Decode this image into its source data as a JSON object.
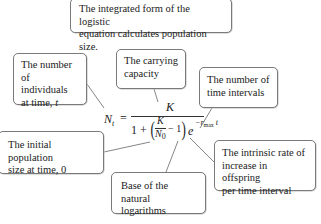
{
  "title_box": {
    "text_1": "The integrated form of the logistic",
    "text_2": "equation calculates population size."
  },
  "callouts": {
    "individuals": {
      "text_1": "The number",
      "text_2": "of individuals",
      "text_3": "at time, ",
      "var": "t"
    },
    "carrying": {
      "text_1": "The carrying",
      "text_2": "capacity"
    },
    "intervals": {
      "text_1": "The number of",
      "text_2": "time intervals"
    },
    "initial": {
      "text_1": "The initial population",
      "text_2": "size at time, 0"
    },
    "intrinsic": {
      "text_1": "The intrinsic rate of",
      "text_2": "increase in offspring",
      "text_3": "per time interval"
    },
    "base": {
      "text_1": "Base of the natural",
      "text_2": "logarithms"
    }
  },
  "equation": {
    "lhs": "N",
    "lhs_sub": "t",
    "equals": "=",
    "numerator": "K",
    "den_one": "1 +",
    "paren_open": "(",
    "frac_num": "K",
    "frac_den": "N",
    "frac_den_sub": "0",
    "minus_one": "− 1",
    "paren_close": ")",
    "e": "e",
    "exp": "−r",
    "exp_sub": "max",
    "exp_t": " t"
  }
}
